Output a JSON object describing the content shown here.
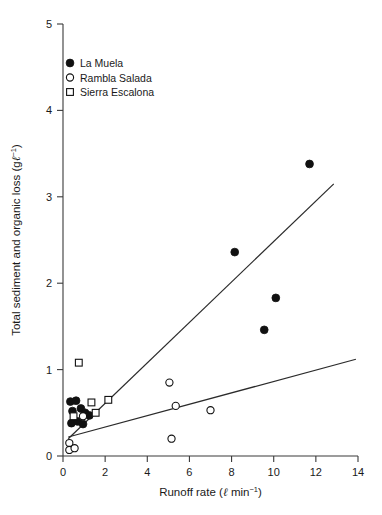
{
  "chart_data": {
    "type": "scatter",
    "title": "",
    "xlabel": "Runoff rate (ℓ min⁻¹)",
    "ylabel": "Total sediment and organic loss (g ℓ⁻¹)",
    "xlim": [
      0,
      14
    ],
    "ylim": [
      0,
      5
    ],
    "xticks": [
      0,
      2,
      4,
      6,
      8,
      10,
      12,
      14
    ],
    "yticks": [
      0,
      1,
      2,
      3,
      4,
      5
    ],
    "xtick_labels": [
      "0",
      "2",
      "4",
      "6",
      "8",
      "10",
      "12",
      "14"
    ],
    "ytick_labels": [
      "0",
      "1",
      "2",
      "3",
      "4",
      "5"
    ],
    "grid": false,
    "legend_position": "upper left",
    "series": [
      {
        "name": "La Muela",
        "marker": "filled-circle",
        "color": "#111111",
        "points": [
          [
            0.35,
            0.63
          ],
          [
            0.62,
            0.64
          ],
          [
            0.45,
            0.52
          ],
          [
            0.85,
            0.55
          ],
          [
            1.05,
            0.5
          ],
          [
            1.25,
            0.47
          ],
          [
            0.4,
            0.38
          ],
          [
            0.7,
            0.4
          ],
          [
            0.95,
            0.37
          ],
          [
            8.15,
            2.36
          ],
          [
            9.55,
            1.46
          ],
          [
            10.1,
            1.83
          ],
          [
            11.7,
            3.38
          ]
        ]
      },
      {
        "name": "Rambla Salada",
        "marker": "open-circle",
        "color": "#ffffff",
        "points": [
          [
            0.3,
            0.15
          ],
          [
            0.3,
            0.07
          ],
          [
            0.55,
            0.09
          ],
          [
            0.95,
            0.46
          ],
          [
            5.05,
            0.85
          ],
          [
            5.15,
            0.2
          ],
          [
            5.35,
            0.58
          ],
          [
            7.0,
            0.53
          ]
        ]
      },
      {
        "name": "Sierra Escalona",
        "marker": "open-square",
        "color": "#ffffff",
        "points": [
          [
            0.75,
            1.08
          ],
          [
            0.5,
            0.46
          ],
          [
            1.35,
            0.62
          ],
          [
            1.55,
            0.5
          ],
          [
            2.15,
            0.65
          ]
        ]
      }
    ],
    "trendlines": [
      {
        "name": "steep-regression-line",
        "x1": 0.25,
        "y1": 0.2,
        "x2": 12.85,
        "y2": 3.15
      },
      {
        "name": "shallow-regression-line",
        "x1": 0.25,
        "y1": 0.22,
        "x2": 13.9,
        "y2": 1.12
      }
    ]
  },
  "legend": {
    "items": [
      {
        "label": "La Muela",
        "marker": "filled-circle"
      },
      {
        "label": "Rambla Salada",
        "marker": "open-circle"
      },
      {
        "label": "Sierra Escalona",
        "marker": "open-square"
      }
    ]
  },
  "axis_title_parts": {
    "y_main": "Total sediment and organic loss (g",
    "y_unit_ell": "ℓ",
    "y_sup": "−1",
    "y_close": ")",
    "x_main": "Runoff rate (",
    "x_unit_ell": "ℓ",
    "x_min": " min",
    "x_sup": "−1",
    "x_close": ")"
  }
}
